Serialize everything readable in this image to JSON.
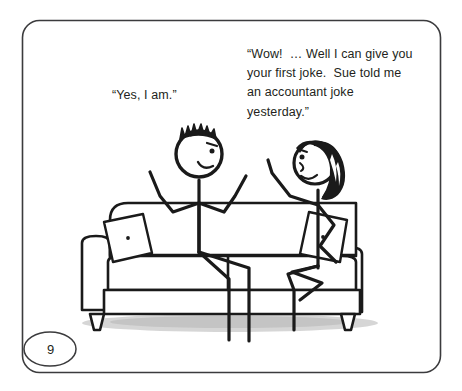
{
  "page": {
    "number": "9",
    "border_color": "#3b3b3d",
    "ink_color": "#1a1a1a",
    "background": "#ffffff",
    "shadow_color": "#c9c9c9"
  },
  "captions": {
    "left": {
      "name": "boy-dialogue",
      "text": "“Yes, I am.”"
    },
    "right": {
      "name": "woman-dialogue",
      "text": "“Wow!  … Well I can give you your first joke.  Sue told me an accountant joke yesterday.”"
    }
  },
  "scene": {
    "description": "Two stick figures sitting on a couch",
    "elements": [
      {
        "name": "couch",
        "label": "couch"
      },
      {
        "name": "couch-left-cushion-pillow",
        "label": "tilted pillow with center tuft"
      },
      {
        "name": "couch-right-cushion-pillow",
        "label": "tilted pillow with center tuft"
      },
      {
        "name": "stick-figure-boy",
        "label": "boy with spiky hair, arms spread"
      },
      {
        "name": "stick-figure-woman",
        "label": "woman with black bobbed hair, legs crossed"
      },
      {
        "name": "floor-shadow",
        "label": "soft shadow under couch"
      }
    ]
  }
}
